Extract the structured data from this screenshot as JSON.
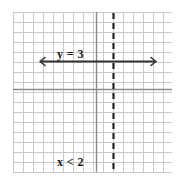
{
  "figure": {
    "name": "coordinate-grid-graph",
    "background_color": "#ffffff",
    "width": 187,
    "height": 187
  },
  "grid": {
    "color": "#c9c9c9",
    "line_width": 1,
    "cell_size": 10,
    "left": 13,
    "top": 12,
    "right": 172,
    "bottom": 172,
    "columns": 16,
    "rows": 16
  },
  "axes": {
    "color": "#8a8a8a",
    "line_width": 1.4,
    "x_axis_y": 89,
    "y_axis_x": 96,
    "x_axis_label": "",
    "y_axis_label": ""
  },
  "labels": {
    "horizontal_line_label": "y = 3",
    "region_label": "x < 2"
  },
  "chart_data": {
    "type": "line",
    "title": "",
    "xlabel": "",
    "ylabel": "",
    "xlim": [
      -8.3,
      7.6
    ],
    "ylim": [
      -8.3,
      7.7
    ],
    "grid": true,
    "legend": null,
    "series": [
      {
        "name": "y = 3",
        "style": "solid",
        "color": "#333333",
        "arrows": "both",
        "equation": "y = 3",
        "orientation": "horizontal",
        "y_value": 3,
        "x_start": -5.6,
        "x_end": 5.9,
        "pixel_y": 61,
        "pixel_x_start": 40,
        "pixel_x_end": 156,
        "label": "y = 3"
      },
      {
        "name": "x = 2",
        "style": "dashed",
        "color": "#222222",
        "arrows": "none",
        "equation": "x = 2",
        "orientation": "vertical",
        "x_value": 2,
        "y_start": -8.3,
        "y_end": 7.7,
        "pixel_x": 113,
        "pixel_y_start": 13,
        "pixel_y_end": 171,
        "dash_length": 6,
        "dash_gap": 4,
        "label": "x < 2"
      }
    ],
    "annotations": [
      {
        "text": "y = 3",
        "pixel_x": 57,
        "pixel_y": 58,
        "bold": true
      },
      {
        "text": "x < 2",
        "pixel_x": 57,
        "pixel_y": 166,
        "bold": true
      }
    ]
  }
}
